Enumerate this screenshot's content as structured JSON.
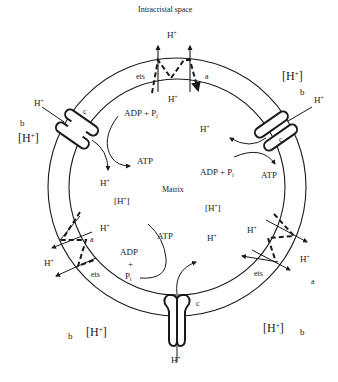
{
  "diagram": {
    "title": "Intracristal space",
    "region_labels": {
      "matrix": "Matrix",
      "intracristal_space": "Intracristal space"
    },
    "symbols": {
      "proton": "H",
      "proton_charge": "+",
      "proton_conc_open": "[H",
      "proton_conc_close": "]",
      "adp_pi": "ADP + P",
      "pi_sub": "i",
      "adp": "ADP",
      "plus": "+",
      "pi": "P",
      "atp": "ATP"
    },
    "component_labels": {
      "ets": "ets",
      "a": "a",
      "b": "b",
      "c": "c"
    },
    "components": [
      {
        "id": "ets-top",
        "type": "electron transport system",
        "label": "ets",
        "position": "top"
      },
      {
        "id": "ets-left",
        "type": "electron transport system",
        "label": "ets",
        "position": "lower-left"
      },
      {
        "id": "ets-right",
        "type": "electron transport system",
        "label": "ets",
        "position": "lower-right"
      },
      {
        "id": "synthase-left",
        "type": "ATP synthase",
        "label": "c",
        "position": "upper-left"
      },
      {
        "id": "synthase-right",
        "type": "ATP synthase",
        "label": "c",
        "position": "upper-right"
      },
      {
        "id": "synthase-bottom",
        "type": "ATP synthase",
        "label": "c",
        "position": "bottom"
      }
    ],
    "colors": {
      "line": "#1a1a1a",
      "background": "#ffffff"
    }
  }
}
